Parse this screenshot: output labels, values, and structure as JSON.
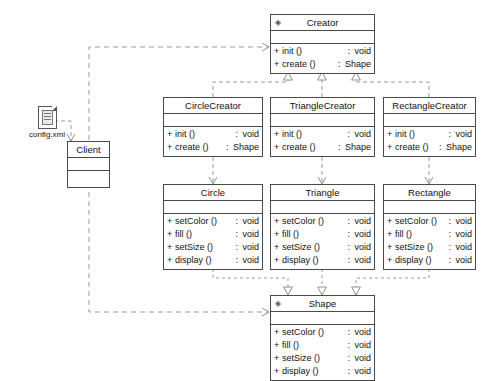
{
  "diagram": {
    "stroke_color": "#4a4a4a",
    "line_color": "#9a9a9a",
    "background": "#ffffff"
  },
  "artifact": {
    "name": "config.xml",
    "icon": "xml-document-icon"
  },
  "classes": {
    "creator": {
      "name": "Creator",
      "stereotype_icon": "interface-icon",
      "attributes": [],
      "operations": [
        {
          "visibility": "+",
          "name": "init ()",
          "colon": ":",
          "type": "void"
        },
        {
          "visibility": "+",
          "name": "create ()",
          "colon": ":",
          "type": "Shape"
        }
      ]
    },
    "client": {
      "name": "Client",
      "attributes": [],
      "operations": []
    },
    "circle_creator": {
      "name": "CircleCreator",
      "attributes": [],
      "operations": [
        {
          "visibility": "+",
          "name": "init ()",
          "colon": ":",
          "type": "void"
        },
        {
          "visibility": "+",
          "name": "create ()",
          "colon": ":",
          "type": "Shape"
        }
      ]
    },
    "triangle_creator": {
      "name": "TriangleCreator",
      "attributes": [],
      "operations": [
        {
          "visibility": "+",
          "name": "init ()",
          "colon": ":",
          "type": "void"
        },
        {
          "visibility": "+",
          "name": "create ()",
          "colon": ":",
          "type": "Shape"
        }
      ]
    },
    "rectangle_creator": {
      "name": "RectangleCreator",
      "attributes": [],
      "operations": [
        {
          "visibility": "+",
          "name": "init ()",
          "colon": ":",
          "type": "void"
        },
        {
          "visibility": "+",
          "name": "create ()",
          "colon": ":",
          "type": "Shape"
        }
      ]
    },
    "circle": {
      "name": "Circle",
      "attributes": [],
      "operations": [
        {
          "visibility": "+",
          "name": "setColor ()",
          "colon": ":",
          "type": "void"
        },
        {
          "visibility": "+",
          "name": "fill ()",
          "colon": ":",
          "type": "void"
        },
        {
          "visibility": "+",
          "name": "setSize ()",
          "colon": ":",
          "type": "void"
        },
        {
          "visibility": "+",
          "name": "display ()",
          "colon": ":",
          "type": "void"
        }
      ]
    },
    "triangle": {
      "name": "Triangle",
      "attributes": [],
      "operations": [
        {
          "visibility": "+",
          "name": "setColor ()",
          "colon": ":",
          "type": "void"
        },
        {
          "visibility": "+",
          "name": "fill ()",
          "colon": ":",
          "type": "void"
        },
        {
          "visibility": "+",
          "name": "setSize ()",
          "colon": ":",
          "type": "void"
        },
        {
          "visibility": "+",
          "name": "display ()",
          "colon": ":",
          "type": "void"
        }
      ]
    },
    "rectangle": {
      "name": "Rectangle",
      "attributes": [],
      "operations": [
        {
          "visibility": "+",
          "name": "setColor ()",
          "colon": ":",
          "type": "void"
        },
        {
          "visibility": "+",
          "name": "fill ()",
          "colon": ":",
          "type": "void"
        },
        {
          "visibility": "+",
          "name": "setSize ()",
          "colon": ":",
          "type": "void"
        },
        {
          "visibility": "+",
          "name": "display ()",
          "colon": ":",
          "type": "void"
        }
      ]
    },
    "shape": {
      "name": "Shape",
      "stereotype_icon": "interface-icon",
      "attributes": [],
      "operations": [
        {
          "visibility": "+",
          "name": "setColor ()",
          "colon": ":",
          "type": "void"
        },
        {
          "visibility": "+",
          "name": "fill ()",
          "colon": ":",
          "type": "void"
        },
        {
          "visibility": "+",
          "name": "setSize ()",
          "colon": ":",
          "type": "void"
        },
        {
          "visibility": "+",
          "name": "display ()",
          "colon": ":",
          "type": "void"
        }
      ]
    }
  },
  "relationships": [
    {
      "from": "config.xml",
      "to": "Client",
      "kind": "dependency"
    },
    {
      "from": "Client",
      "to": "Creator",
      "kind": "dependency"
    },
    {
      "from": "Client",
      "to": "Shape",
      "kind": "dependency"
    },
    {
      "from": "CircleCreator",
      "to": "Creator",
      "kind": "realization"
    },
    {
      "from": "TriangleCreator",
      "to": "Creator",
      "kind": "realization"
    },
    {
      "from": "RectangleCreator",
      "to": "Creator",
      "kind": "realization"
    },
    {
      "from": "CircleCreator",
      "to": "Circle",
      "kind": "dependency"
    },
    {
      "from": "TriangleCreator",
      "to": "Triangle",
      "kind": "dependency"
    },
    {
      "from": "RectangleCreator",
      "to": "Rectangle",
      "kind": "dependency"
    },
    {
      "from": "Circle",
      "to": "Shape",
      "kind": "realization"
    },
    {
      "from": "Triangle",
      "to": "Shape",
      "kind": "realization"
    },
    {
      "from": "Rectangle",
      "to": "Shape",
      "kind": "realization"
    }
  ]
}
